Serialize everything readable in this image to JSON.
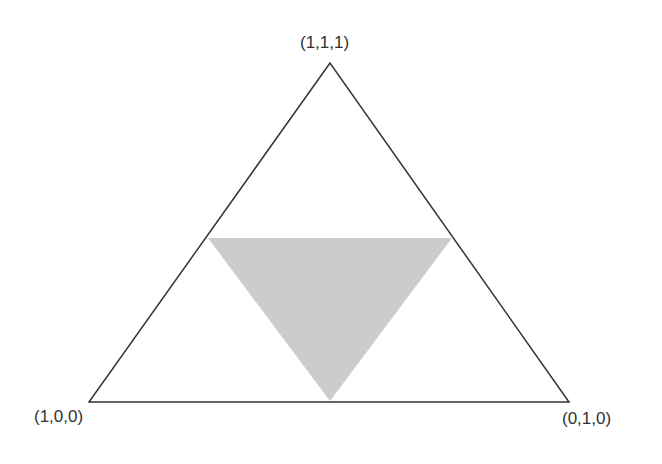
{
  "diagram": {
    "type": "simplex-triangle",
    "colors": {
      "outline": "#333333",
      "fill": "#cccccc",
      "background": "#ffffff"
    },
    "outer_triangle": {
      "vertices": [
        {
          "label": "(1,1,1)",
          "x": 330,
          "y": 63
        },
        {
          "label": "(1,0,0)",
          "x": 89,
          "y": 402
        },
        {
          "label": "(0,1,0)",
          "x": 569,
          "y": 402
        }
      ]
    },
    "inner_triangle": {
      "vertices": [
        {
          "x": 208,
          "y": 238
        },
        {
          "x": 452,
          "y": 238
        },
        {
          "x": 330,
          "y": 401
        }
      ]
    },
    "labels": {
      "top": "(1,1,1)",
      "bottom_left": "(1,0,0)",
      "bottom_right": "(0,1,0)"
    }
  }
}
